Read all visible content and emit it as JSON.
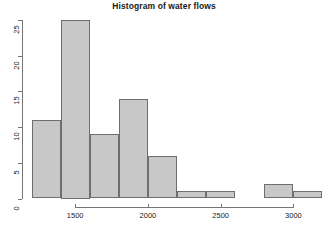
{
  "chart_data": {
    "type": "bar",
    "title": "Histogram of water flows",
    "xlabel": "",
    "ylabel": "",
    "bin_width": 200,
    "bin_edges": [
      1200,
      1400,
      1600,
      1800,
      2000,
      2200,
      2400,
      2600,
      2800,
      3000,
      3200
    ],
    "categories": [
      "1200-1400",
      "1400-1600",
      "1600-1800",
      "1800-2000",
      "2000-2200",
      "2200-2400",
      "2400-2600",
      "2600-2800",
      "2800-3000",
      "3000-3200"
    ],
    "values": [
      11,
      25,
      9,
      14,
      6,
      1,
      1,
      0,
      2,
      1
    ],
    "xlim": [
      1200,
      3200
    ],
    "ylim": [
      0,
      25
    ],
    "xticks": [
      1500,
      2000,
      2500,
      3000
    ],
    "xtick_labels": [
      "1500",
      "2000",
      "2500",
      "3000"
    ],
    "yticks": [
      0,
      5,
      10,
      15,
      20,
      25
    ],
    "ytick_labels": [
      "0",
      "5",
      "10",
      "15",
      "20",
      "25"
    ],
    "grid": false,
    "legend": null,
    "bar_fill_color": "#c8c8c8",
    "bar_border_color": "#6e6e6e",
    "axis_color": "#767676",
    "text_color": "#1a1a1a",
    "background_color": "#ffffff"
  }
}
